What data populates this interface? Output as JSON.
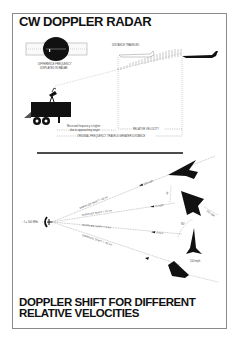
{
  "top_panel": {
    "title": "CW DOPPLER RADAR",
    "scope_caption_1": "DIFFERENCE FREQUENCY",
    "scope_caption_2": "DISPLAYED IN RADAR",
    "distance_label": "DISTANCE TRAVELED",
    "received_label_1": "Received frequency is higher",
    "received_label_2": "due to approaching target",
    "relative_velocity_label": "RELATIVE VELOCITY",
    "original_frequency_label": "ORIGINAL FREQUENCY TRAVELS GREATER DISTANCE"
  },
  "bottom_panel": {
    "title": "DOPPLER SHIFT FOR DIFFERENT RELATIVE VELOCITIES",
    "radar_label": "f = 100 MHz",
    "rays": [
      {
        "shift_label": "DOPPLER SHIFT = 30 Hz",
        "speed_label": "100 mph"
      },
      {
        "shift_label": "DOPPLER SHIFT = 21 Hz",
        "speed_label": "71 mph"
      },
      {
        "shift_label": "DOPPLER SHIFT = 0 Hz",
        "speed_label": "0 mph"
      },
      {
        "shift_label": "DOPPLER SHIFT = -30 Hz",
        "speed_label": "100 mph"
      }
    ],
    "angle_labels": [
      "45°",
      "90°"
    ],
    "aircraft_speed_labels": [
      "100 mph",
      "100 mph"
    ]
  }
}
